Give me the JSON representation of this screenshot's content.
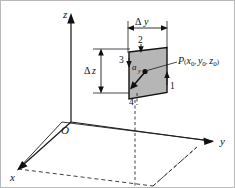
{
  "figure": {
    "background_color": "#ffffff",
    "patch_fill_color": "#b6b6b6",
    "line_color": "#111111"
  },
  "axes": {
    "z_label": "z",
    "y_label": "y",
    "x_label": "x",
    "origin_label": "O"
  },
  "dimensions": {
    "width_delta": "Δ",
    "width_var": "y",
    "height_delta": "Δ",
    "height_var": "z"
  },
  "faces": {
    "face_1": "1",
    "face_2": "2",
    "face_3": "3",
    "face_4": "4"
  },
  "vector": {
    "symbol": "a",
    "subscript": "y"
  },
  "point": {
    "name": "P",
    "open_paren": "(",
    "coord_x": "x",
    "coord_x_sub": "0",
    "comma_1": ", ",
    "coord_y": "y",
    "coord_y_sub": "0",
    "comma_2": ", ",
    "coord_z": "z",
    "coord_z_sub": "0",
    "close_paren": ")"
  }
}
